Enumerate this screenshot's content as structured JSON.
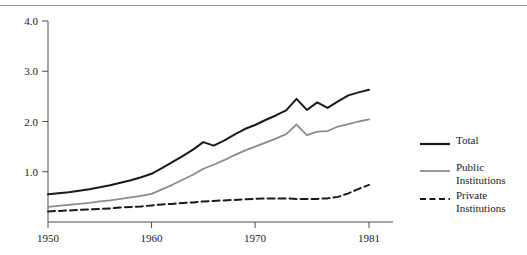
{
  "chart_data": {
    "type": "line",
    "title": "",
    "subtitle": "",
    "xlabel": "",
    "ylabel": "",
    "xlim": [
      1950,
      1981
    ],
    "ylim": [
      0.0,
      4.0
    ],
    "grid": false,
    "legend_position": "right",
    "x_ticks": [
      "1950",
      "1960",
      "1970",
      "1981"
    ],
    "x_tick_values": [
      1950,
      1960,
      1970,
      1981
    ],
    "y_ticks": [
      "1.0",
      "2.0",
      "3.0",
      "4.0"
    ],
    "y_tick_values": [
      1.0,
      2.0,
      3.0,
      4.0
    ],
    "x": [
      1950,
      1951,
      1952,
      1953,
      1954,
      1955,
      1956,
      1957,
      1958,
      1959,
      1960,
      1961,
      1962,
      1963,
      1964,
      1965,
      1966,
      1967,
      1968,
      1969,
      1970,
      1971,
      1972,
      1973,
      1974,
      1975,
      1976,
      1977,
      1978,
      1979,
      1980,
      1981
    ],
    "series": [
      {
        "name": "Total",
        "color": "#1a1a1a",
        "style": "solid",
        "width": 2.0,
        "values": [
          0.55,
          0.57,
          0.59,
          0.62,
          0.65,
          0.69,
          0.73,
          0.78,
          0.83,
          0.89,
          0.96,
          1.07,
          1.19,
          1.31,
          1.44,
          1.59,
          1.52,
          1.62,
          1.74,
          1.85,
          1.93,
          2.03,
          2.12,
          2.22,
          2.45,
          2.23,
          2.38,
          2.27,
          2.4,
          2.52,
          2.58,
          2.63
        ]
      },
      {
        "name": "Public Institutions",
        "color": "#8c8c8c",
        "style": "solid",
        "width": 1.8,
        "values": [
          0.3,
          0.32,
          0.34,
          0.36,
          0.38,
          0.41,
          0.43,
          0.46,
          0.49,
          0.52,
          0.56,
          0.65,
          0.74,
          0.84,
          0.94,
          1.06,
          1.14,
          1.23,
          1.33,
          1.42,
          1.5,
          1.58,
          1.66,
          1.75,
          1.94,
          1.73,
          1.8,
          1.81,
          1.9,
          1.95,
          2.0,
          2.04
        ]
      },
      {
        "name": "Private Institutions",
        "color": "#1a1a1a",
        "style": "dashed",
        "width": 2.0,
        "values": [
          0.21,
          0.22,
          0.23,
          0.24,
          0.25,
          0.26,
          0.27,
          0.29,
          0.3,
          0.31,
          0.33,
          0.35,
          0.36,
          0.38,
          0.39,
          0.41,
          0.42,
          0.43,
          0.44,
          0.45,
          0.46,
          0.47,
          0.47,
          0.47,
          0.46,
          0.46,
          0.46,
          0.47,
          0.5,
          0.57,
          0.66,
          0.74
        ]
      }
    ]
  },
  "legend": {
    "items": [
      {
        "label": "Total",
        "style": "solid",
        "color": "#1a1a1a"
      },
      {
        "label": "Public\nInstitutions",
        "style": "solid",
        "color": "#8c8c8c"
      },
      {
        "label": "Private\nInstitutions",
        "style": "dashed",
        "color": "#1a1a1a"
      }
    ]
  },
  "colors": {
    "total": "#1a1a1a",
    "public": "#8c8c8c",
    "private": "#1a1a1a",
    "axis": "#4d4d4d",
    "rule": "#999999",
    "background": "#ffffff"
  }
}
